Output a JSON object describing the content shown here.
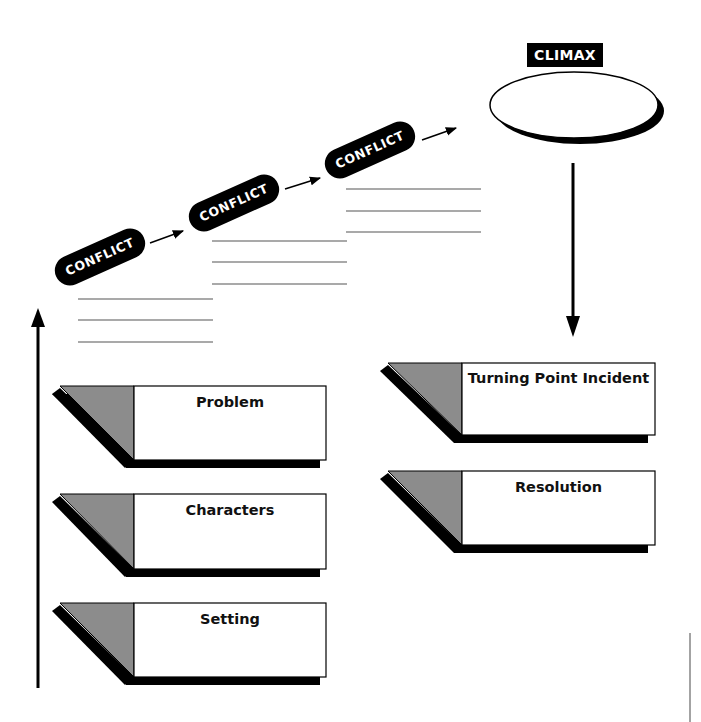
{
  "diagram": {
    "type": "story-plot-organizer",
    "climax": {
      "label": "CLIMAX"
    },
    "conflicts": [
      {
        "label": "CONFLICT",
        "answer_lines": 3
      },
      {
        "label": "CONFLICT",
        "answer_lines": 3
      },
      {
        "label": "CONFLICT",
        "answer_lines": 3
      }
    ],
    "left_column_boxes": [
      {
        "title": "Problem"
      },
      {
        "title": "Characters"
      },
      {
        "title": "Setting"
      }
    ],
    "right_column_boxes": [
      {
        "title": "Turning Point Incident"
      },
      {
        "title": "Resolution"
      }
    ],
    "colors": {
      "ink": "#000000",
      "fold_gray": "#8c8c8c",
      "line_gray": "#555555",
      "background": "#ffffff"
    }
  }
}
